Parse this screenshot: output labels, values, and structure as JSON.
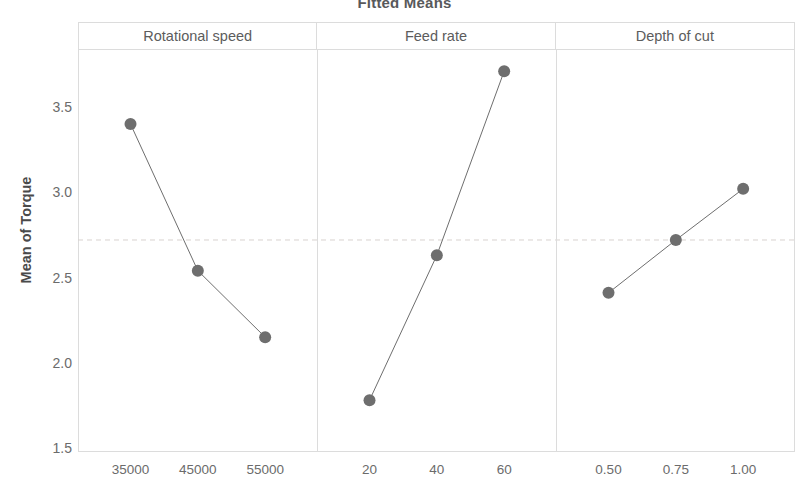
{
  "chart_data": {
    "type": "line",
    "title": "Fitted Means",
    "xlabel": "",
    "ylabel": "Mean of Torque",
    "ylim": [
      1.5,
      3.75
    ],
    "y_ticks": [
      1.5,
      2.0,
      2.5,
      3.0,
      3.5
    ],
    "y_tick_labels": [
      "1.5",
      "2.0",
      "2.5",
      "3.0",
      "3.5"
    ],
    "grid": false,
    "legend": "none",
    "reference_line": {
      "orientation": "horizontal",
      "value": 2.72,
      "style": "dashed",
      "color": "#d9d2cf",
      "label": "grand mean"
    },
    "marker_color": "#6e6e6e",
    "line_color": "#6e6e6e",
    "panels": [
      {
        "name": "Rotational speed",
        "categories": [
          "35000",
          "45000",
          "55000"
        ],
        "values": [
          3.4,
          2.54,
          2.15
        ]
      },
      {
        "name": "Feed rate",
        "categories": [
          "20",
          "40",
          "60"
        ],
        "values": [
          1.78,
          2.63,
          3.71
        ]
      },
      {
        "name": "Depth of cut",
        "categories": [
          "0.50",
          "0.75",
          "1.00"
        ],
        "values": [
          2.41,
          2.72,
          3.02
        ]
      }
    ]
  },
  "title": {
    "text": "Fitted Means"
  },
  "axes": {
    "y_title": "Mean of Torque"
  }
}
